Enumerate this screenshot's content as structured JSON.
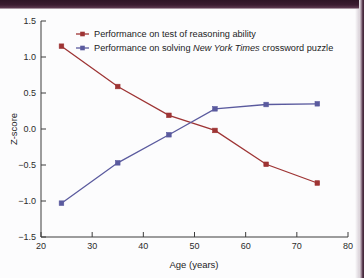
{
  "figure": {
    "name": "z-score-vs-age-line-chart",
    "background_color": "#fcfcfd",
    "scan_band_color": "#3b1c30"
  },
  "chart_data": {
    "type": "line",
    "title": "",
    "subtitle": "",
    "xlabel": "Age (years)",
    "ylabel": "Z-score",
    "xlim": [
      20,
      80
    ],
    "ylim": [
      -1.5,
      1.5
    ],
    "xticks": [
      20,
      30,
      40,
      50,
      60,
      70,
      80
    ],
    "xtick_labels": [
      "20",
      "30",
      "40",
      "50",
      "60",
      "70",
      "80"
    ],
    "yticks": [
      -1.5,
      -1.0,
      -0.5,
      0.0,
      0.5,
      1.0,
      1.5
    ],
    "ytick_labels": [
      "-1.5",
      "-1.0",
      "-0.5",
      "0.0",
      "0.5",
      "1.0",
      "1.5"
    ],
    "grid": false,
    "legend_position": "top-center",
    "x": [
      24,
      35,
      45,
      54,
      64,
      74
    ],
    "series": [
      {
        "name": "Performance on test of reasoning ability",
        "legend_label": "Performance on test of reasoning ability",
        "color": "#9e3434",
        "marker": "square",
        "values": [
          1.15,
          0.59,
          0.19,
          -0.02,
          -0.49,
          -0.75
        ]
      },
      {
        "name": "Performance on solving New York Times crossword puzzle",
        "legend_label_parts": [
          {
            "text": "Performance on solving ",
            "italic": false
          },
          {
            "text": "New York Times",
            "italic": true
          },
          {
            "text": " crossword puzzle",
            "italic": false
          }
        ],
        "color": "#5a5a9e",
        "marker": "square",
        "values": [
          -1.03,
          -0.47,
          -0.08,
          0.28,
          0.34,
          0.35
        ]
      }
    ],
    "annotations": []
  }
}
